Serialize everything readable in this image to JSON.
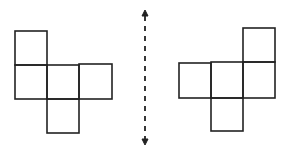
{
  "diagram": {
    "stroke_color": "#222222",
    "background": "#ffffff",
    "left_net": {
      "squares": [
        {
          "x": 15,
          "y": 31,
          "w": 32,
          "h": 34
        },
        {
          "x": 15,
          "y": 65,
          "w": 32,
          "h": 34
        },
        {
          "x": 47,
          "y": 65,
          "w": 32,
          "h": 34
        },
        {
          "x": 79,
          "y": 64,
          "w": 33,
          "h": 35
        },
        {
          "x": 47,
          "y": 99,
          "w": 32,
          "h": 34
        }
      ]
    },
    "mirror_axis": {
      "type": "dashed-double-arrow",
      "x": 145,
      "y_top": 10,
      "y_bottom": 145
    },
    "right_net": {
      "squares": [
        {
          "x": 243,
          "y": 28,
          "w": 32,
          "h": 34
        },
        {
          "x": 179,
          "y": 63,
          "w": 32,
          "h": 35
        },
        {
          "x": 211,
          "y": 62,
          "w": 32,
          "h": 36
        },
        {
          "x": 243,
          "y": 62,
          "w": 32,
          "h": 36
        },
        {
          "x": 211,
          "y": 98,
          "w": 32,
          "h": 33
        }
      ]
    }
  }
}
